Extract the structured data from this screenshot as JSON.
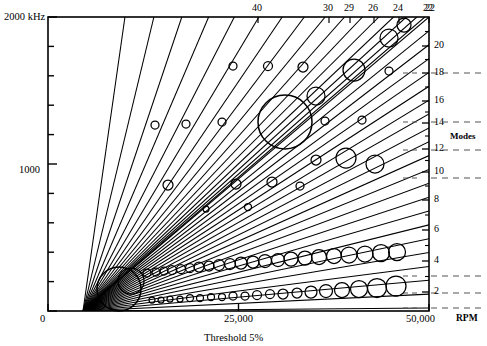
{
  "chart_data": {
    "type": "line",
    "title": "",
    "subtitle": "Threshold 5%",
    "xlabel": "RPM",
    "ylabel": "kHz",
    "xlim": [
      0,
      50000
    ],
    "ylim": [
      0,
      2000
    ],
    "grid": false,
    "legend_position": "none",
    "x_ticks": [
      {
        "value": 0,
        "label": "0"
      },
      {
        "value": 25000,
        "label": "25,000"
      },
      {
        "value": 50000,
        "label": "50,000"
      }
    ],
    "y_ticks": [
      {
        "value": 2000,
        "label": "2000 kHz"
      },
      {
        "value": 1800,
        "label": ""
      },
      {
        "value": 1600,
        "label": ""
      },
      {
        "value": 1400,
        "label": ""
      },
      {
        "value": 1200,
        "label": ""
      },
      {
        "value": 1000,
        "label": "1000"
      },
      {
        "value": 800,
        "label": ""
      },
      {
        "value": 600,
        "label": ""
      },
      {
        "value": 400,
        "label": ""
      },
      {
        "value": 200,
        "label": ""
      },
      {
        "value": 0,
        "label": "0"
      }
    ],
    "top_axis_label": "",
    "top_ticks": [
      {
        "label": "40",
        "x": 258
      },
      {
        "label": "30",
        "x": 329
      },
      {
        "label": "29",
        "x": 350
      },
      {
        "label": "26",
        "x": 374
      },
      {
        "label": "24",
        "x": 399
      },
      {
        "label": "22",
        "x": 429
      }
    ],
    "right_axis_title": "Modes",
    "right_ticks": [
      {
        "label": "22",
        "y": 17
      },
      {
        "label": "20",
        "y": 46
      },
      {
        "label": "18",
        "y": 73
      },
      {
        "label": "16",
        "y": 101
      },
      {
        "label": "14",
        "y": 123
      },
      {
        "label": "12",
        "y": 149
      },
      {
        "label": "10",
        "y": 172
      },
      {
        "label": "8",
        "y": 200
      },
      {
        "label": "6",
        "y": 230
      },
      {
        "label": "4",
        "y": 261
      },
      {
        "label": "2",
        "y": 292
      }
    ],
    "dashed_marker_rows": [
      73,
      122,
      150,
      178,
      276,
      293,
      308
    ],
    "series_note": "Radial engine-order lines from origin with response circles sized by amplitude",
    "origin": {
      "x": 83,
      "y": 311
    },
    "order_lines_count": 38,
    "response_circles": [
      {
        "x": 119,
        "y": 289,
        "r": 22
      },
      {
        "x": 131,
        "y": 281,
        "r": 13
      },
      {
        "x": 147,
        "y": 273,
        "r": 4
      },
      {
        "x": 156,
        "y": 272,
        "r": 4
      },
      {
        "x": 164,
        "y": 271,
        "r": 4
      },
      {
        "x": 172,
        "y": 270,
        "r": 4.5
      },
      {
        "x": 181,
        "y": 269,
        "r": 4.5
      },
      {
        "x": 190,
        "y": 268,
        "r": 4.5
      },
      {
        "x": 199,
        "y": 267,
        "r": 5
      },
      {
        "x": 209,
        "y": 266,
        "r": 5
      },
      {
        "x": 219,
        "y": 265,
        "r": 5.5
      },
      {
        "x": 230,
        "y": 264,
        "r": 5.5
      },
      {
        "x": 241,
        "y": 263,
        "r": 6
      },
      {
        "x": 253,
        "y": 262,
        "r": 6
      },
      {
        "x": 265,
        "y": 261,
        "r": 6.5
      },
      {
        "x": 278,
        "y": 260,
        "r": 6.5
      },
      {
        "x": 291,
        "y": 259,
        "r": 7
      },
      {
        "x": 305,
        "y": 258,
        "r": 7
      },
      {
        "x": 319,
        "y": 257,
        "r": 7.5
      },
      {
        "x": 334,
        "y": 256,
        "r": 7.5
      },
      {
        "x": 349,
        "y": 255,
        "r": 8
      },
      {
        "x": 365,
        "y": 254,
        "r": 8
      },
      {
        "x": 381,
        "y": 253,
        "r": 8.5
      },
      {
        "x": 397,
        "y": 252,
        "r": 8.5
      },
      {
        "x": 152,
        "y": 300,
        "r": 3
      },
      {
        "x": 161,
        "y": 300,
        "r": 3
      },
      {
        "x": 170,
        "y": 299,
        "r": 3
      },
      {
        "x": 180,
        "y": 299,
        "r": 3
      },
      {
        "x": 190,
        "y": 298,
        "r": 3.5
      },
      {
        "x": 200,
        "y": 298,
        "r": 3.5
      },
      {
        "x": 211,
        "y": 297,
        "r": 3.5
      },
      {
        "x": 222,
        "y": 297,
        "r": 3.5
      },
      {
        "x": 233,
        "y": 296,
        "r": 4
      },
      {
        "x": 245,
        "y": 296,
        "r": 4
      },
      {
        "x": 257,
        "y": 295,
        "r": 4.5
      },
      {
        "x": 270,
        "y": 294,
        "r": 4.5
      },
      {
        "x": 283,
        "y": 294,
        "r": 5
      },
      {
        "x": 297,
        "y": 293,
        "r": 5
      },
      {
        "x": 311,
        "y": 292,
        "r": 6
      },
      {
        "x": 326,
        "y": 291,
        "r": 6.5
      },
      {
        "x": 342,
        "y": 290,
        "r": 7.5
      },
      {
        "x": 359,
        "y": 289,
        "r": 8.5
      },
      {
        "x": 377,
        "y": 288,
        "r": 9.5
      },
      {
        "x": 396,
        "y": 286,
        "r": 10
      },
      {
        "x": 285,
        "y": 122,
        "r": 27
      },
      {
        "x": 354,
        "y": 70,
        "r": 11
      },
      {
        "x": 316,
        "y": 96,
        "r": 9
      },
      {
        "x": 389,
        "y": 38,
        "r": 9
      },
      {
        "x": 404,
        "y": 25,
        "r": 7
      },
      {
        "x": 346,
        "y": 158,
        "r": 10
      },
      {
        "x": 375,
        "y": 164,
        "r": 9
      },
      {
        "x": 233,
        "y": 66,
        "r": 4
      },
      {
        "x": 268,
        "y": 66,
        "r": 4.5
      },
      {
        "x": 303,
        "y": 67,
        "r": 5
      },
      {
        "x": 389,
        "y": 71,
        "r": 4
      },
      {
        "x": 155,
        "y": 125,
        "r": 4
      },
      {
        "x": 186,
        "y": 124,
        "r": 4
      },
      {
        "x": 222,
        "y": 122,
        "r": 4
      },
      {
        "x": 325,
        "y": 121,
        "r": 4
      },
      {
        "x": 362,
        "y": 120,
        "r": 4
      },
      {
        "x": 168,
        "y": 185,
        "r": 5
      },
      {
        "x": 236,
        "y": 184,
        "r": 5
      },
      {
        "x": 272,
        "y": 182,
        "r": 5
      },
      {
        "x": 316,
        "y": 160,
        "r": 5
      },
      {
        "x": 300,
        "y": 186,
        "r": 4
      },
      {
        "x": 206,
        "y": 209,
        "r": 3
      },
      {
        "x": 248,
        "y": 207,
        "r": 3.5
      }
    ]
  },
  "axes": {
    "y_top_label": "2000 kHz",
    "y_mid_label": "1000",
    "y_zero_label": "0",
    "x_zero_label": "0",
    "x_mid_label": "25,000",
    "x_max_label": "50,000",
    "x_unit_label": "RPM",
    "caption": "Threshold 5%",
    "modes_label": "Modes"
  }
}
